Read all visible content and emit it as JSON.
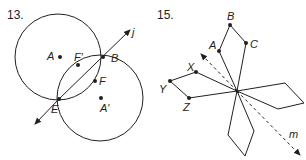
{
  "problems": [
    {
      "number": "13.",
      "line_label": "j",
      "points": {
        "A": "A",
        "A_prime": "A′",
        "B": "B",
        "E": "E",
        "F": "F",
        "F_prime": "F′"
      }
    },
    {
      "number": "15.",
      "line_label": "m",
      "points": {
        "A": "A",
        "B": "B",
        "C": "C",
        "X": "X",
        "Y": "Y",
        "Z": "Z"
      }
    }
  ],
  "colors": {
    "ink": "#231f20",
    "background": "#ffffff"
  }
}
